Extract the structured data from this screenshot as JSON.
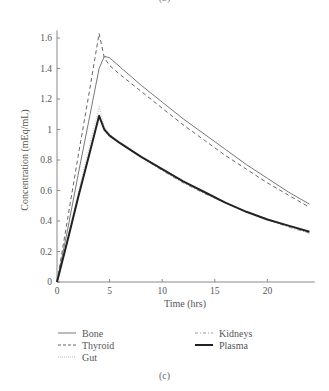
{
  "captions": {
    "top": "(b)",
    "bottom": "(c)"
  },
  "chart_data": {
    "type": "line",
    "title": "",
    "xlabel": "Time (hrs)",
    "ylabel": "Concentration (mEq/mL)",
    "xlim": [
      0,
      24.5
    ],
    "ylim": [
      0,
      1.65
    ],
    "xticks": [
      0,
      5,
      10,
      15,
      20
    ],
    "xtick_labels": [
      "0",
      "5",
      "10",
      "15",
      "20"
    ],
    "yticks": [
      0,
      0.2,
      0.4,
      0.6,
      0.8,
      1,
      1.2,
      1.4,
      1.6
    ],
    "ytick_labels": [
      "0",
      "0.2",
      "0.4",
      "0.6",
      "0.8",
      "1",
      "1.2",
      "1.4",
      "1.6"
    ],
    "grid": false,
    "legend_position": "below",
    "x": [
      0,
      1,
      2,
      3,
      4,
      4.5,
      5,
      6,
      8,
      10,
      12,
      14,
      16,
      18,
      20,
      22,
      24
    ],
    "series": [
      {
        "name": "Bone",
        "style": "solid-thin",
        "color": "#777777",
        "values": [
          0.0,
          0.34,
          0.7,
          1.05,
          1.4,
          1.48,
          1.47,
          1.41,
          1.29,
          1.18,
          1.07,
          0.97,
          0.87,
          0.77,
          0.68,
          0.59,
          0.51
        ]
      },
      {
        "name": "Thyroid",
        "style": "dashed",
        "color": "#666666",
        "values": [
          0.0,
          0.41,
          0.82,
          1.22,
          1.63,
          1.47,
          1.42,
          1.36,
          1.25,
          1.14,
          1.03,
          0.93,
          0.83,
          0.74,
          0.65,
          0.57,
          0.49
        ]
      },
      {
        "name": "Gut",
        "style": "dotted-light",
        "color": "#bbbbbb",
        "values": [
          0.0,
          0.29,
          0.58,
          0.87,
          1.15,
          1.02,
          0.97,
          0.92,
          0.82,
          0.74,
          0.66,
          0.59,
          0.52,
          0.46,
          0.41,
          0.37,
          0.33
        ]
      },
      {
        "name": "Kidneys",
        "style": "dash-dot",
        "color": "#999999",
        "values": [
          0.0,
          0.27,
          0.55,
          0.82,
          1.09,
          1.0,
          0.96,
          0.91,
          0.82,
          0.73,
          0.65,
          0.58,
          0.52,
          0.46,
          0.41,
          0.36,
          0.32
        ]
      },
      {
        "name": "Plasma",
        "style": "solid-thick",
        "color": "#222222",
        "values": [
          0.0,
          0.27,
          0.55,
          0.82,
          1.09,
          1.0,
          0.96,
          0.91,
          0.82,
          0.74,
          0.66,
          0.59,
          0.52,
          0.46,
          0.41,
          0.37,
          0.33
        ]
      }
    ]
  },
  "legend": {
    "items": [
      {
        "label": "Bone"
      },
      {
        "label": "Thyroid"
      },
      {
        "label": "Gut"
      },
      {
        "label": "Kidneys"
      },
      {
        "label": "Plasma"
      }
    ]
  }
}
